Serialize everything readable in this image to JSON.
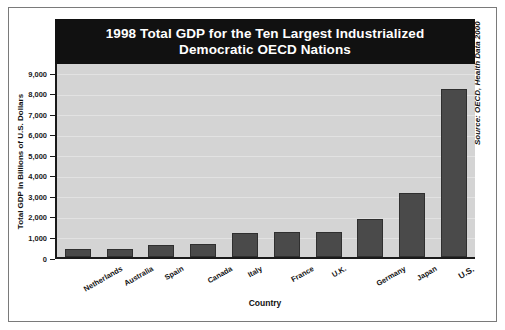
{
  "chart_data": {
    "type": "bar",
    "title": "1998 Total GDP for the Ten Largest Industrialized\nDemocratic OECD Nations",
    "xlabel": "Country",
    "ylabel": "Total GDP in Billions of U.S. Dollars",
    "ylim": [
      0,
      9500
    ],
    "yticks": [
      0,
      1000,
      2000,
      3000,
      4000,
      5000,
      6000,
      7000,
      8000,
      9000
    ],
    "ytick_labels": [
      "0",
      "1,000",
      "2,000",
      "3,000",
      "4,000",
      "5,000",
      "6,000",
      "7,000",
      "8,000",
      "9,000"
    ],
    "categories": [
      "Netherlands",
      "Australia",
      "Spain",
      "Canada",
      "Italy",
      "France",
      "U.K.",
      "Germany",
      "Japan",
      "U.S."
    ],
    "values": [
      390,
      400,
      600,
      620,
      1180,
      1200,
      1220,
      1850,
      3100,
      8200
    ],
    "grid": true,
    "legend": "none",
    "source": "Source: OECD, Health Data 2000",
    "colors": {
      "bar_fill": "#4a4a4a",
      "bar_edge": "#2f2f2f",
      "plot_background": "#d4d4d4",
      "title_banner": "#111111",
      "title_text": "#ffffff",
      "axis": "#1a1a1a",
      "gridline": "#e2e2e2",
      "page_background": "#ffffff",
      "frame": "#7a7a7a"
    }
  }
}
